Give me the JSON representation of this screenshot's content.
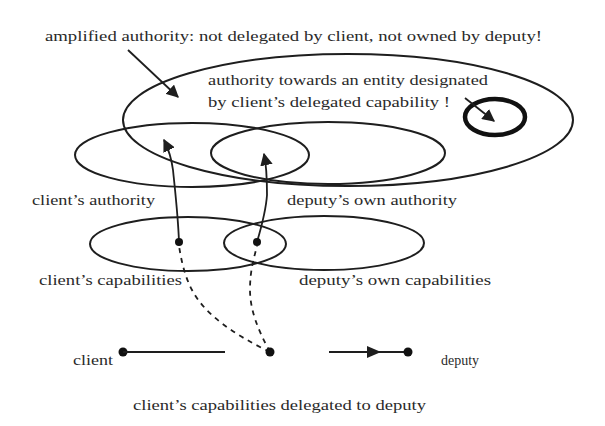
{
  "diagram": {
    "title_annotation": "amplified authority: not delegated by client, not owned by deputy!",
    "designated_entity_annotation": {
      "line1": "authority towards an entity designated",
      "line2": "by client’s delegated capability !"
    },
    "sets": {
      "client_authority": "client’s authority",
      "deputy_authority": "deputy’s own authority",
      "client_capabilities": "client’s capabilities",
      "deputy_capabilities": "deputy’s own capabilities"
    },
    "nodes": {
      "client": "client",
      "deputy": "deputy"
    },
    "edge_caption": "client’s capabilities delegated to deputy",
    "colors": {
      "ink": "#1e1e1e",
      "background": "#ffffff"
    }
  }
}
